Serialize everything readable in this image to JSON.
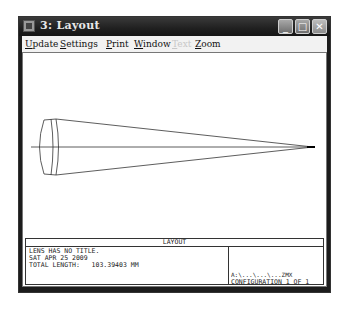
{
  "window": {
    "title": "3: Layout",
    "controls": {
      "minimize": "_",
      "maximize": "□",
      "close": "✕"
    }
  },
  "menu": [
    {
      "label": "Update",
      "accel": "U",
      "rest": "pdate",
      "enabled": true
    },
    {
      "label": "Settings",
      "accel": "S",
      "rest": "ettings",
      "enabled": true
    },
    {
      "label": "Print",
      "accel": "P",
      "rest": "rint",
      "enabled": true
    },
    {
      "label": "Window",
      "accel": "W",
      "rest": "indow",
      "enabled": true
    },
    {
      "label": "Text",
      "accel": "T",
      "rest": "ext",
      "enabled": false
    },
    {
      "label": "Zoom",
      "accel": "Z",
      "rest": "oom",
      "enabled": true
    }
  ],
  "plot": {
    "heading": "LAYOUT",
    "info_lines": [
      "LENS HAS NO TITLE.",
      "SAT APR 25 2009",
      "TOTAL LENGTH:   103.39403 MM"
    ],
    "file_path": "A:\\...\\...\\...ZMX",
    "configuration": "CONFIGURATION  1  OF  1"
  },
  "icons": {
    "app": "zemax-app-icon"
  }
}
